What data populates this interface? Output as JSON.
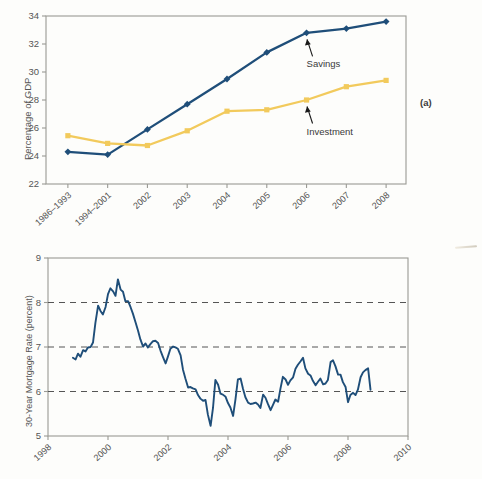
{
  "figure": {
    "panel_a_tag": "(a)",
    "panel_b_tag": "(b)"
  },
  "colors": {
    "savings_line": "#1f4e79",
    "investment_line": "#f2ca5c",
    "mortgage_line": "#1f4e79",
    "axis": "#9a9a94",
    "grid_dashed": "#555555",
    "text": "#555555"
  },
  "chart_data": [
    {
      "type": "line",
      "id": "panel-a",
      "title": "",
      "xlabel": "",
      "ylabel": "Percentage of GDP",
      "ylim": [
        22,
        34
      ],
      "yticks": [
        "22",
        "24",
        "26",
        "28",
        "30",
        "32",
        "34"
      ],
      "ytick_values": [
        22,
        24,
        26,
        28,
        30,
        32,
        34
      ],
      "grid": false,
      "legend": "annotations",
      "categories": [
        "1986–1993",
        "1994–2001",
        "2002",
        "2003",
        "2004",
        "2005",
        "2006",
        "2007",
        "2008"
      ],
      "series": [
        {
          "name": "Savings",
          "color": "#1f4e79",
          "marker": "diamond",
          "values": [
            24.3,
            24.1,
            25.9,
            27.7,
            29.5,
            31.4,
            32.8,
            33.1,
            33.6
          ]
        },
        {
          "name": "Investment",
          "color": "#f2ca5c",
          "marker": "square",
          "values": [
            25.45,
            24.9,
            24.75,
            25.8,
            27.2,
            27.3,
            28.0,
            28.95,
            29.4
          ]
        }
      ],
      "annotations": [
        {
          "text": "Savings",
          "points_to_series": "Savings",
          "points_to_category": "2006"
        },
        {
          "text": "Investment",
          "points_to_series": "Investment",
          "points_to_category": "2006"
        }
      ]
    },
    {
      "type": "line",
      "id": "panel-b",
      "title": "",
      "xlabel": "",
      "ylabel": "30-Year Mortgage Rate (percent)",
      "ylim": [
        5,
        9
      ],
      "yticks": [
        "5",
        "6",
        "7",
        "8",
        "9"
      ],
      "ytick_values": [
        5,
        6,
        7,
        8,
        9
      ],
      "xlim": [
        1998,
        2010
      ],
      "xticks": [
        "1998",
        "2000",
        "2002",
        "2004",
        "2006",
        "2008",
        "2010"
      ],
      "xtick_values": [
        1998,
        2000,
        2002,
        2004,
        2006,
        2008,
        2010
      ],
      "grid": true,
      "gridlines_y": [
        6,
        7,
        8
      ],
      "grid_style": "dashed",
      "series": [
        {
          "name": "30-Year Mortgage Rate",
          "color": "#1f4e79",
          "marker": "none",
          "x": [
            1998.83,
            1998.92,
            1999.0,
            1999.08,
            1999.17,
            1999.25,
            1999.33,
            1999.42,
            1999.5,
            1999.58,
            1999.67,
            1999.75,
            1999.83,
            1999.92,
            2000.0,
            2000.08,
            2000.17,
            2000.25,
            2000.33,
            2000.42,
            2000.5,
            2000.58,
            2000.67,
            2000.75,
            2000.83,
            2000.92,
            2001.0,
            2001.08,
            2001.17,
            2001.25,
            2001.33,
            2001.42,
            2001.5,
            2001.58,
            2001.67,
            2001.75,
            2001.83,
            2001.92,
            2002.0,
            2002.08,
            2002.17,
            2002.25,
            2002.33,
            2002.42,
            2002.5,
            2002.58,
            2002.67,
            2002.75,
            2002.83,
            2002.92,
            2003.0,
            2003.08,
            2003.17,
            2003.25,
            2003.33,
            2003.42,
            2003.5,
            2003.58,
            2003.67,
            2003.75,
            2003.83,
            2003.92,
            2004.0,
            2004.08,
            2004.17,
            2004.25,
            2004.33,
            2004.42,
            2004.5,
            2004.58,
            2004.67,
            2004.75,
            2004.83,
            2004.92,
            2005.0,
            2005.08,
            2005.17,
            2005.25,
            2005.33,
            2005.42,
            2005.5,
            2005.58,
            2005.67,
            2005.75,
            2005.83,
            2005.92,
            2006.0,
            2006.08,
            2006.17,
            2006.25,
            2006.33,
            2006.42,
            2006.5,
            2006.58,
            2006.67,
            2006.75,
            2006.83,
            2006.92,
            2007.0,
            2007.08,
            2007.17,
            2007.25,
            2007.33,
            2007.42,
            2007.5,
            2007.58,
            2007.67,
            2007.75,
            2007.83,
            2007.92,
            2008.0,
            2008.08,
            2008.17,
            2008.25,
            2008.33,
            2008.42,
            2008.5,
            2008.58,
            2008.67,
            2008.75
          ],
          "y": [
            6.76,
            6.72,
            6.85,
            6.78,
            6.93,
            6.9,
            6.99,
            7.0,
            7.1,
            7.54,
            7.93,
            7.81,
            7.73,
            7.9,
            8.19,
            8.32,
            8.25,
            8.15,
            8.52,
            8.29,
            8.24,
            8.03,
            8.03,
            7.9,
            7.75,
            7.55,
            7.37,
            7.17,
            7.01,
            7.08,
            6.99,
            7.07,
            7.13,
            7.14,
            7.09,
            6.92,
            6.78,
            6.63,
            6.79,
            6.96,
            7.01,
            6.99,
            6.96,
            6.81,
            6.49,
            6.29,
            6.09,
            6.1,
            6.07,
            6.05,
            5.92,
            5.84,
            5.79,
            5.81,
            5.48,
            5.23,
            5.63,
            6.26,
            6.15,
            5.95,
            5.93,
            5.88,
            5.74,
            5.64,
            5.45,
            5.83,
            6.27,
            6.29,
            6.06,
            5.87,
            5.75,
            5.72,
            5.73,
            5.75,
            5.71,
            5.63,
            5.93,
            5.86,
            5.72,
            5.58,
            5.7,
            5.82,
            5.77,
            6.07,
            6.33,
            6.27,
            6.15,
            6.25,
            6.32,
            6.51,
            6.6,
            6.68,
            6.76,
            6.52,
            6.4,
            6.36,
            6.24,
            6.14,
            6.22,
            6.29,
            6.16,
            6.18,
            6.26,
            6.66,
            6.7,
            6.57,
            6.38,
            6.38,
            6.21,
            6.1,
            5.76,
            5.92,
            5.97,
            5.92,
            6.04,
            6.32,
            6.43,
            6.48,
            6.52,
            6.04
          ]
        }
      ]
    }
  ]
}
